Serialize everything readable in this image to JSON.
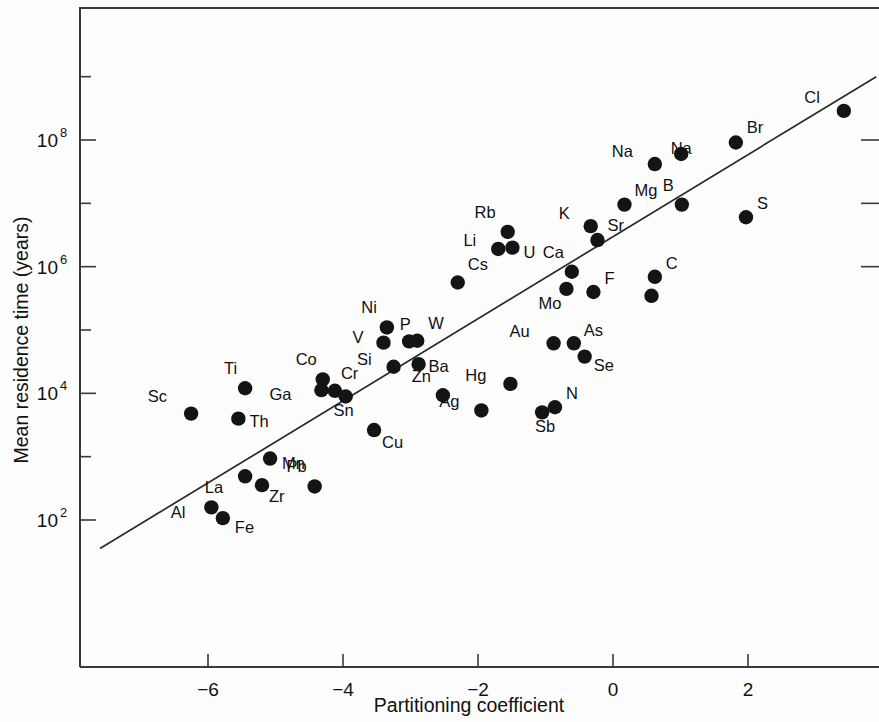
{
  "chart_data": {
    "type": "scatter",
    "title": "",
    "xlabel": "Partitioning coefficient",
    "ylabel": "Mean residence time (years)",
    "xlim": [
      -7.6,
      3.9
    ],
    "ylim_exponent": [
      1.0,
      9.3
    ],
    "yscale": "log",
    "xticks": [
      -6,
      -4,
      -2,
      0,
      2
    ],
    "xtick_labels": [
      "−6",
      "−4",
      "−2",
      "0",
      "2"
    ],
    "yticks_exponent": [
      2,
      4,
      6,
      8
    ],
    "ytick_labels": [
      "10",
      "10",
      "10",
      "10"
    ],
    "ytick_exponents": [
      "2",
      "4",
      "6",
      "8"
    ],
    "yticks_minor_exponent": [
      3,
      5,
      7,
      9
    ],
    "grid": false,
    "legend": null,
    "trendline": {
      "label": "regression line",
      "x_start": -7.6,
      "y_start_exponent": 1.55,
      "x_end": 3.9,
      "y_end_exponent": 9.0
    },
    "point_labels_note": "element symbol shown next to each marker",
    "points": [
      {
        "label": "Sc",
        "x": -6.25,
        "y_exponent": 3.68,
        "label_dx": -24,
        "label_dy": -12
      },
      {
        "label": "Ti",
        "x": -5.45,
        "y_exponent": 4.08,
        "label_dx": -8,
        "label_dy": -14
      },
      {
        "label": "Th",
        "x": -5.55,
        "y_exponent": 3.6,
        "label_dx": 11,
        "label_dy": 8
      },
      {
        "label": "Co",
        "x": -4.3,
        "y_exponent": 4.22,
        "label_dx": -6,
        "label_dy": -14
      },
      {
        "label": "Ga",
        "x": -4.32,
        "y_exponent": 4.05,
        "label_dx": -30,
        "label_dy": 10
      },
      {
        "label": "Cr",
        "x": -4.12,
        "y_exponent": 4.04,
        "label_dx": 6,
        "label_dy": -12
      },
      {
        "label": "Sn",
        "x": -3.96,
        "y_exponent": 3.95,
        "label_dx": -2,
        "label_dy": 20
      },
      {
        "label": "Cu",
        "x": -3.54,
        "y_exponent": 3.42,
        "label_dx": 8,
        "label_dy": 18
      },
      {
        "label": "Mn",
        "x": -5.08,
        "y_exponent": 2.97,
        "label_dx": 12,
        "label_dy": 10
      },
      {
        "label": "La",
        "x": -5.45,
        "y_exponent": 2.69,
        "label_dx": -22,
        "label_dy": 17
      },
      {
        "label": "Zr",
        "x": -5.2,
        "y_exponent": 2.55,
        "label_dx": 7,
        "label_dy": 17
      },
      {
        "label": "Pb",
        "x": -4.42,
        "y_exponent": 2.53,
        "label_dx": -8,
        "label_dy": -14
      },
      {
        "label": "Al",
        "x": -5.95,
        "y_exponent": 2.2,
        "label_dx": -26,
        "label_dy": 11
      },
      {
        "label": "Fe",
        "x": -5.78,
        "y_exponent": 2.03,
        "label_dx": 12,
        "label_dy": 15
      },
      {
        "label": "Ni",
        "x": -3.35,
        "y_exponent": 5.04,
        "label_dx": -10,
        "label_dy": -14
      },
      {
        "label": "V",
        "x": -3.4,
        "y_exponent": 4.8,
        "label_dx": -20,
        "label_dy": 0
      },
      {
        "label": "P",
        "x": -3.02,
        "y_exponent": 4.82,
        "label_dx": -4,
        "label_dy": -11
      },
      {
        "label": "W",
        "x": -2.9,
        "y_exponent": 4.83,
        "label_dx": 11,
        "label_dy": -12
      },
      {
        "label": "Si",
        "x": -3.25,
        "y_exponent": 4.42,
        "label_dx": -22,
        "label_dy": -2
      },
      {
        "label": "Ba",
        "x": -2.88,
        "y_exponent": 4.46,
        "label_dx": 10,
        "label_dy": 8
      },
      {
        "label": "Zn",
        "x": -2.52,
        "y_exponent": 3.97,
        "label_dx": -12,
        "label_dy": -13
      },
      {
        "label": "Cs",
        "x": -2.3,
        "y_exponent": 5.75,
        "label_dx": 10,
        "label_dy": -12
      },
      {
        "label": "Li",
        "x": -1.7,
        "y_exponent": 6.28,
        "label_dx": -22,
        "label_dy": -3
      },
      {
        "label": "Rb",
        "x": -1.56,
        "y_exponent": 6.55,
        "label_dx": -12,
        "label_dy": -14
      },
      {
        "label": "U",
        "x": -1.49,
        "y_exponent": 6.3,
        "label_dx": 11,
        "label_dy": 10
      },
      {
        "label": "Hg",
        "x": -1.52,
        "y_exponent": 4.15,
        "label_dx": -24,
        "label_dy": -3
      },
      {
        "label": "Ag",
        "x": -1.95,
        "y_exponent": 3.73,
        "label_dx": -22,
        "label_dy": -3
      },
      {
        "label": "Sb",
        "x": -1.05,
        "y_exponent": 3.7,
        "label_dx": 3,
        "label_dy": 20
      },
      {
        "label": "N",
        "x": -0.86,
        "y_exponent": 3.78,
        "label_dx": 11,
        "label_dy": -8
      },
      {
        "label": "Au",
        "x": -0.88,
        "y_exponent": 4.79,
        "label_dx": -24,
        "label_dy": -6
      },
      {
        "label": "As",
        "x": -0.58,
        "y_exponent": 4.79,
        "label_dx": 10,
        "label_dy": -7
      },
      {
        "label": "Se",
        "x": -0.42,
        "y_exponent": 4.58,
        "label_dx": 9,
        "label_dy": 14
      },
      {
        "label": "Mo",
        "x": -0.69,
        "y_exponent": 5.65,
        "label_dx": -5,
        "label_dy": 20
      },
      {
        "label": "Ca",
        "x": -0.61,
        "y_exponent": 5.92,
        "label_dx": -8,
        "label_dy": -14
      },
      {
        "label": "F",
        "x": -0.29,
        "y_exponent": 5.6,
        "label_dx": 11,
        "label_dy": -8
      },
      {
        "label": "K",
        "x": -0.33,
        "y_exponent": 6.64,
        "label_dx": -21,
        "label_dy": -7
      },
      {
        "label": "Sr",
        "x": -0.23,
        "y_exponent": 6.42,
        "label_dx": 10,
        "label_dy": -9
      },
      {
        "label": "Mg",
        "x": 0.17,
        "y_exponent": 6.98,
        "label_dx": 10,
        "label_dy": -9
      },
      {
        "label": "Na",
        "x": 0.62,
        "y_exponent": 7.62,
        "label_dx": -22,
        "label_dy": -7
      },
      {
        "label": "B",
        "x": 1.02,
        "y_exponent": 6.98,
        "label_dx": -8,
        "label_dy": -14
      },
      {
        "label": "C",
        "x": 0.62,
        "y_exponent": 5.84,
        "label_dx": 11,
        "label_dy": -8
      },
      {
        "label": "",
        "x": 0.57,
        "y_exponent": 5.54,
        "label_dx": 0,
        "label_dy": 0
      },
      {
        "label": "S",
        "x": 1.97,
        "y_exponent": 6.78,
        "label_dx": 11,
        "label_dy": -8
      },
      {
        "label": "Br",
        "x": 1.82,
        "y_exponent": 7.96,
        "label_dx": 11,
        "label_dy": -10
      },
      {
        "label": "Na2",
        "x": 1.01,
        "y_exponent": 7.78,
        "label_dx": 0,
        "label_dy": 0
      },
      {
        "label": "Cl",
        "x": 3.42,
        "y_exponent": 8.46,
        "label_dx": -24,
        "label_dy": -8
      }
    ]
  },
  "axes": {
    "x_title": "Partitioning coefficient",
    "y_title": "Mean residence time (years)",
    "y_base": "10"
  }
}
